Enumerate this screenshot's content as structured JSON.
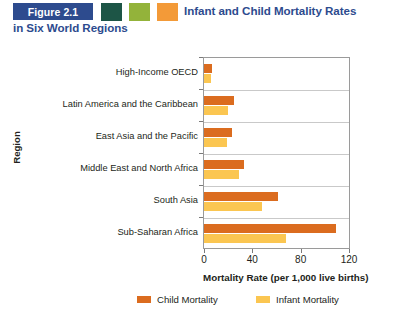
{
  "header": {
    "figure_badge": "Figure 2.1",
    "title_line1": "Infant and Child Mortality Rates",
    "title_line2": "in Six World Regions",
    "swatch_colors": [
      "#1d5546",
      "#93b33a",
      "#f39a38"
    ],
    "badge_color": "#2d4b8e",
    "title_color": "#2d4b8e"
  },
  "chart_data": {
    "type": "bar",
    "orientation": "horizontal",
    "title": "Infant and Child Mortality Rates in Six World Regions",
    "categories": [
      "High-Income OECD",
      "Latin America and the Caribbean",
      "East Asia and the Pacific",
      "Middle East and North Africa",
      "South Asia",
      "Sub-Saharan Africa"
    ],
    "series": [
      {
        "name": "Child Mortality",
        "color": "#db6c1f",
        "values": [
          7,
          25,
          23,
          33,
          61,
          109
        ]
      },
      {
        "name": "Infant Mortality",
        "color": "#fbc651",
        "values": [
          6,
          20,
          19,
          29,
          48,
          68
        ]
      }
    ],
    "xlabel": "Mortality Rate (per 1,000 live births)",
    "ylabel": "Region",
    "xlim": [
      0,
      120
    ],
    "xticks": [
      0,
      40,
      80,
      120
    ],
    "xtick_labels": [
      "0",
      "40",
      "80",
      "120"
    ],
    "grid": true,
    "grid_axis": "y",
    "legend_position": "bottom"
  }
}
